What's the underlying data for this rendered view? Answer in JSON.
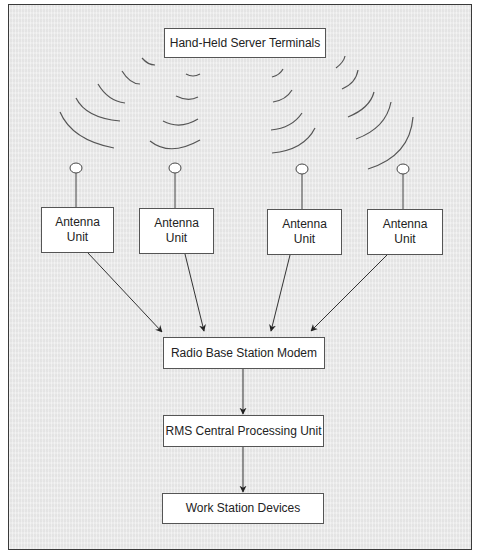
{
  "diagram": {
    "top_box": "Hand-Held Server Terminals",
    "antennas": [
      {
        "line1": "Antenna",
        "line2": "Unit"
      },
      {
        "line1": "Antenna",
        "line2": "Unit"
      },
      {
        "line1": "Antenna",
        "line2": "Unit"
      },
      {
        "line1": "Antenna",
        "line2": "Unit"
      }
    ],
    "base_station": "Radio Base Station Modem",
    "cpu": "RMS Central Processing Unit",
    "workstations": "Work Station Devices"
  },
  "colors": {
    "background": "#ececec",
    "box_fill": "#ffffff",
    "line": "#444444"
  }
}
